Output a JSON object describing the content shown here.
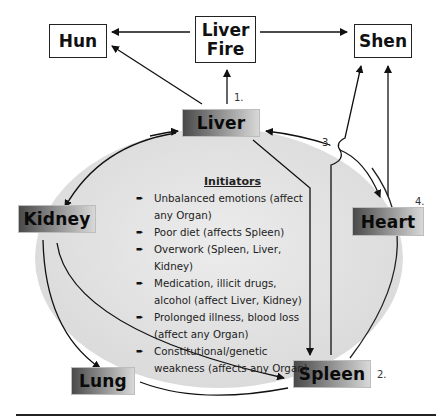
{
  "diagram": {
    "top_boxes": {
      "hun": "Hun",
      "liver_fire": "Liver\nFire",
      "liver_fire_line1": "Liver",
      "liver_fire_line2": "Fire",
      "shen": "Shen"
    },
    "organs": {
      "liver": "Liver",
      "kidney": "Kidney",
      "heart": "Heart",
      "lung": "Lung",
      "spleen": "Spleen"
    },
    "step_numbers": {
      "n1": "1.",
      "n2": "2.",
      "n3": "3.",
      "n4": "4."
    },
    "initiators": {
      "title": "Initiators",
      "bullet_icon": "➨",
      "items": [
        "Unbalanced emotions (affect any Organ)",
        "Poor diet (affects Spleen)",
        "Overwork (Spleen, Liver, Kidney)",
        "Medication, illicit drugs, alcohol (affect Liver, Kidney)",
        "Prolonged illness, blood loss (affect any Organ)",
        "Constitutional/genetic weakness (affects any Organ)"
      ]
    },
    "colors": {
      "ellipse_fill": "#e4e4e4",
      "line": "#222222",
      "organ_dark": "#4a4a4a",
      "organ_light": "#d8d8d8"
    }
  }
}
